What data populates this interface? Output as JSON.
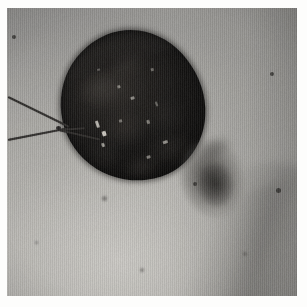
{
  "image": {
    "kind": "clinical-photograph",
    "caption": "Clinical photograph of skin showing a large dark necrotic eschar with adjacent bruising and suture threads",
    "width_px": 307,
    "height_px": 307,
    "border": {
      "color": "#fdfdfc",
      "left_px": 7,
      "top_px": 8,
      "right_px": 10,
      "bottom_px": 11
    },
    "plate": {
      "width_px": 290,
      "height_px": 288,
      "background_color": "#a9a9a7"
    }
  },
  "palette": {
    "skin_light": "#b3b2ae",
    "skin_mid": "#a9a8a4",
    "skin_dark": "#8f8e8c",
    "eschar_dark": "#100f0e",
    "eschar_mid": "#2a2724",
    "bruise": "#3e3c39",
    "suture": "#2c2a28",
    "highlight": "#d8d4cc",
    "border": "#fdfdfc"
  },
  "features": {
    "lesion": {
      "label": "necrotic eschar",
      "shape": "oval",
      "center_x_px": 125,
      "center_y_px": 98,
      "width_px": 143,
      "height_px": 152,
      "rotation_deg": -18,
      "color": "#100f0e"
    },
    "bruise": {
      "label": "ecchymosis",
      "center_x_px": 212,
      "center_y_px": 179,
      "width_px": 62,
      "height_px": 80,
      "rotation_deg": -10,
      "color": "#3e3c39"
    },
    "sutures": {
      "label": "suture threads",
      "count": 3,
      "color": "#2c2a28"
    },
    "moles": {
      "label": "naevi",
      "count": 6,
      "color": "#282624"
    },
    "crease": {
      "label": "body crease shadow",
      "position": "lower-right"
    }
  },
  "texture": {
    "scan_lines": "vertical",
    "grain": "film-grain"
  },
  "crusts": [
    {
      "left_pct": 14,
      "top_pct": 20,
      "w_pct": 34,
      "h_pct": 26,
      "color": "rgba(62,58,54,0.55)"
    },
    {
      "left_pct": 40,
      "top_pct": 12,
      "w_pct": 30,
      "h_pct": 22,
      "color": "rgba(48,45,42,0.50)"
    },
    {
      "left_pct": 20,
      "top_pct": 48,
      "w_pct": 40,
      "h_pct": 28,
      "color": "rgba(56,52,48,0.42)"
    },
    {
      "left_pct": 52,
      "top_pct": 46,
      "w_pct": 34,
      "h_pct": 32,
      "color": "rgba(34,32,30,0.55)"
    },
    {
      "left_pct": 8,
      "top_pct": 60,
      "w_pct": 26,
      "h_pct": 26,
      "color": "rgba(30,28,26,0.60)"
    },
    {
      "left_pct": 46,
      "top_pct": 72,
      "w_pct": 38,
      "h_pct": 24,
      "color": "rgba(44,41,38,0.45)"
    },
    {
      "left_pct": 60,
      "top_pct": 22,
      "w_pct": 26,
      "h_pct": 34,
      "color": "rgba(26,24,22,0.55)"
    },
    {
      "left_pct": 28,
      "top_pct": 80,
      "w_pct": 30,
      "h_pct": 20,
      "color": "rgba(52,48,45,0.40)"
    }
  ],
  "speculars": [
    {
      "left_pct": 22,
      "top_pct": 52,
      "w_px": 3,
      "h_px": 7,
      "opacity": 0.85
    },
    {
      "left_pct": 24,
      "top_pct": 60,
      "w_px": 4,
      "h_px": 5,
      "opacity": 0.95
    },
    {
      "left_pct": 21,
      "top_pct": 67,
      "w_px": 3,
      "h_px": 4,
      "opacity": 0.7
    },
    {
      "left_pct": 44,
      "top_pct": 34,
      "w_px": 3,
      "h_px": 3,
      "opacity": 0.55
    },
    {
      "left_pct": 50,
      "top_pct": 44,
      "w_px": 4,
      "h_px": 3,
      "opacity": 0.6
    },
    {
      "left_pct": 38,
      "top_pct": 56,
      "w_px": 3,
      "h_px": 3,
      "opacity": 0.5
    },
    {
      "left_pct": 56,
      "top_pct": 62,
      "w_px": 3,
      "h_px": 4,
      "opacity": 0.55
    },
    {
      "left_pct": 62,
      "top_pct": 78,
      "w_px": 5,
      "h_px": 3,
      "opacity": 0.65
    },
    {
      "left_pct": 48,
      "top_pct": 84,
      "w_px": 4,
      "h_px": 3,
      "opacity": 0.55
    },
    {
      "left_pct": 70,
      "top_pct": 30,
      "w_px": 3,
      "h_px": 3,
      "opacity": 0.45
    },
    {
      "left_pct": 34,
      "top_pct": 20,
      "w_px": 3,
      "h_px": 2,
      "opacity": 0.4
    },
    {
      "left_pct": 66,
      "top_pct": 52,
      "w_px": 2,
      "h_px": 5,
      "opacity": 0.45
    }
  ],
  "threads": [
    {
      "x_px": 1,
      "y_px": 88,
      "len_px": 68,
      "angle_deg": 26,
      "thick_px": 2
    },
    {
      "x_px": 1,
      "y_px": 131,
      "len_px": 62,
      "angle_deg": -11,
      "thick_px": 2
    },
    {
      "x_px": 52,
      "y_px": 121,
      "len_px": 42,
      "angle_deg": 13,
      "thick_px": 2
    },
    {
      "x_px": 52,
      "y_px": 121,
      "len_px": 26,
      "angle_deg": -4,
      "thick_px": 2
    }
  ],
  "thread_knots": [
    {
      "x_px": 49,
      "y_px": 118
    }
  ],
  "mole_points": [
    {
      "x_px": 12,
      "y_px": 35,
      "d_px": 4,
      "soft": false
    },
    {
      "x_px": 270,
      "y_px": 72,
      "d_px": 4,
      "soft": false
    },
    {
      "x_px": 276,
      "y_px": 188,
      "d_px": 5,
      "soft": false
    },
    {
      "x_px": 193,
      "y_px": 182,
      "d_px": 4,
      "soft": false
    },
    {
      "x_px": 102,
      "y_px": 196,
      "d_px": 5,
      "soft": true
    },
    {
      "x_px": 140,
      "y_px": 268,
      "d_px": 4,
      "soft": true
    },
    {
      "x_px": 243,
      "y_px": 252,
      "d_px": 4,
      "soft": true
    },
    {
      "x_px": 35,
      "y_px": 241,
      "d_px": 3,
      "soft": true
    }
  ]
}
